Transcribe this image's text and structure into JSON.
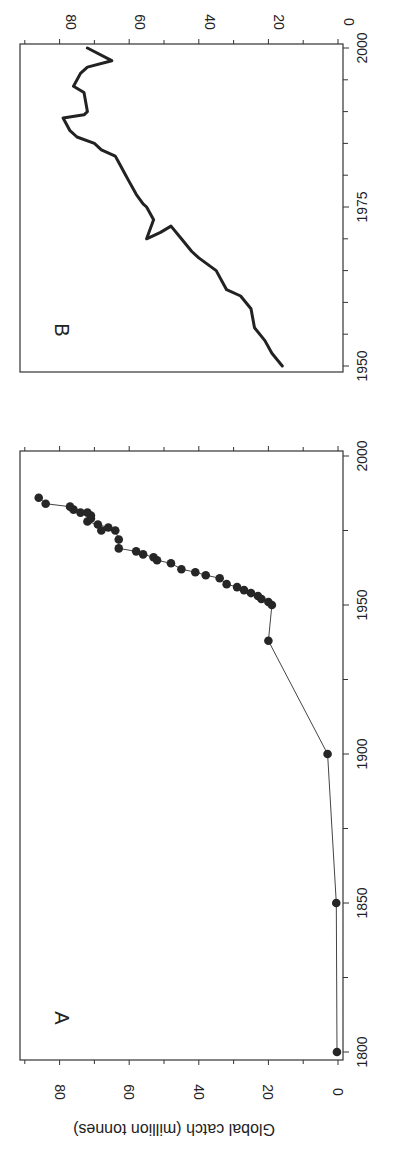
{
  "figure": {
    "ylabel": "Global catch (million tonnes)",
    "rotation_deg": 90
  },
  "chart_data": [
    {
      "panel": "A",
      "type": "line",
      "marker": "circle",
      "title": "",
      "xlabel": "",
      "ylabel": "Global catch (million tonnes)",
      "xlim": [
        1800,
        2000
      ],
      "ylim": [
        0,
        90
      ],
      "xticks": [
        1800,
        1850,
        1900,
        1950,
        2000
      ],
      "xticks_minor": [
        1825,
        1875,
        1925,
        1975
      ],
      "yticks": [
        0,
        20,
        40,
        60,
        80
      ],
      "yticks_minor": [
        10,
        30,
        50,
        70,
        90
      ],
      "grid": false,
      "color": "#222222",
      "x": [
        1800,
        1850,
        1900,
        1938,
        1950,
        1951,
        1952,
        1953,
        1954,
        1955,
        1956,
        1957,
        1959,
        1960,
        1961,
        1962,
        1964,
        1965,
        1966,
        1967,
        1968,
        1969,
        1972,
        1975,
        1975,
        1976,
        1977,
        1978,
        1979,
        1980,
        1981,
        1981,
        1982,
        1983,
        1984,
        1986
      ],
      "y": [
        0.3,
        0.5,
        3,
        20,
        19,
        20,
        22,
        23,
        25,
        27,
        29,
        32,
        34,
        38,
        41,
        45,
        48,
        52,
        53,
        56,
        58,
        63,
        63,
        64,
        68,
        66,
        69,
        72,
        71,
        71,
        72,
        74,
        76,
        77,
        84,
        86
      ]
    },
    {
      "panel": "B",
      "type": "line",
      "marker": "none",
      "title": "",
      "xlabel": "",
      "ylabel": "",
      "xlim": [
        1950,
        2000
      ],
      "ylim": [
        0,
        90
      ],
      "xticks": [
        1950,
        1975,
        2000
      ],
      "xticks_minor": [
        1955,
        1960,
        1965,
        1970,
        1980,
        1985,
        1990,
        1995
      ],
      "yticks": [
        0,
        20,
        40,
        60,
        80
      ],
      "yticks_minor": [
        10,
        30,
        50,
        70,
        90
      ],
      "grid": false,
      "color": "#222222",
      "x": [
        1950,
        1952,
        1954,
        1956,
        1959,
        1961,
        1962,
        1965,
        1967,
        1968,
        1970,
        1972,
        1971,
        1970,
        1973,
        1975,
        1975.5,
        1977,
        1979,
        1980,
        1982,
        1983,
        1984,
        1985,
        1986,
        1987,
        1989,
        1989.5,
        1990,
        1993,
        1994,
        1996,
        1997,
        1998,
        2000
      ],
      "y": [
        16,
        19,
        21,
        24,
        25,
        28,
        32,
        35,
        40,
        42,
        45,
        48,
        51,
        55,
        53,
        55,
        56,
        58,
        60,
        61,
        63,
        64,
        68,
        70,
        75,
        77,
        79,
        73,
        72,
        73,
        76,
        74,
        72,
        65,
        72
      ]
    }
  ]
}
